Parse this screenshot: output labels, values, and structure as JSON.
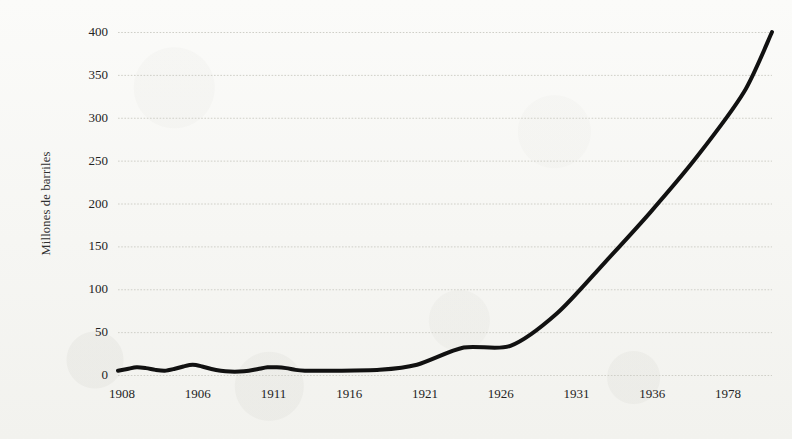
{
  "chart_data": {
    "type": "line",
    "title": "",
    "subtitle": "",
    "xlabel": "",
    "ylabel": "Millones de barriles",
    "ylim": [
      0,
      400
    ],
    "ytick_labels": [
      "400",
      "350",
      "300",
      "250",
      "200",
      "150",
      "100",
      "50",
      "0"
    ],
    "ytick_values": [
      400,
      350,
      300,
      250,
      200,
      150,
      100,
      50,
      0
    ],
    "xtick_labels": [
      "1908",
      "1906",
      "1911",
      "1916",
      "1921",
      "1926",
      "1931",
      "1936",
      "1978"
    ],
    "grid": true,
    "grid_style": "dotted",
    "grid_color": "#cfcfc8",
    "legend": "none",
    "line_color": "#111111",
    "line_width": 4,
    "background_color": "#f7f7f4",
    "series": [
      {
        "name": "Millones de barriles",
        "x": [
          "1908",
          "1906",
          "1911",
          "1916",
          "1921",
          "1926",
          "1931",
          "1936",
          "1978"
        ],
        "values": [
          5,
          9,
          6,
          12,
          4,
          9,
          5,
          6,
          400
        ]
      }
    ],
    "points": [
      {
        "x": 1908,
        "y": 5
      },
      {
        "x": 1909,
        "y": 7
      },
      {
        "x": 1910,
        "y": 9
      },
      {
        "x": 1911,
        "y": 8
      },
      {
        "x": 1912,
        "y": 6
      },
      {
        "x": 1913,
        "y": 5
      },
      {
        "x": 1914,
        "y": 7
      },
      {
        "x": 1915,
        "y": 10
      },
      {
        "x": 1916,
        "y": 12
      },
      {
        "x": 1917,
        "y": 10
      },
      {
        "x": 1918,
        "y": 7
      },
      {
        "x": 1919,
        "y": 5
      },
      {
        "x": 1920,
        "y": 4
      },
      {
        "x": 1921,
        "y": 4
      },
      {
        "x": 1922,
        "y": 5
      },
      {
        "x": 1923,
        "y": 7
      },
      {
        "x": 1924,
        "y": 9
      },
      {
        "x": 1925,
        "y": 9
      },
      {
        "x": 1926,
        "y": 8
      },
      {
        "x": 1927,
        "y": 6
      },
      {
        "x": 1928,
        "y": 5
      },
      {
        "x": 1929,
        "y": 5
      },
      {
        "x": 1931,
        "y": 5
      },
      {
        "x": 1936,
        "y": 6
      },
      {
        "x": 1940,
        "y": 12
      },
      {
        "x": 1945,
        "y": 32
      },
      {
        "x": 1950,
        "y": 34
      },
      {
        "x": 1955,
        "y": 72
      },
      {
        "x": 1960,
        "y": 130
      },
      {
        "x": 1965,
        "y": 190
      },
      {
        "x": 1970,
        "y": 255
      },
      {
        "x": 1975,
        "y": 330
      },
      {
        "x": 1978,
        "y": 400
      }
    ],
    "annotations": []
  },
  "figure": {
    "y_axis_title": "Millones de barriles"
  }
}
